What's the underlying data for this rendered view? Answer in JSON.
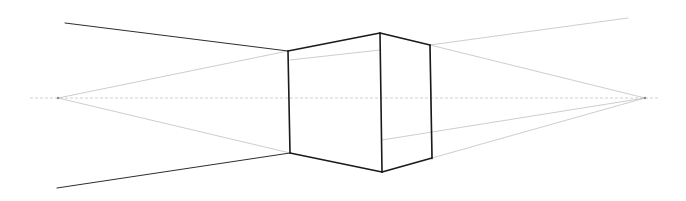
{
  "drawing": {
    "title": "Two-point perspective box sketch",
    "background": "#ffffff",
    "horizon_line": {
      "x1": 30,
      "y1": 98,
      "x2": 660,
      "y2": 98
    },
    "vanishing_points": {
      "left": {
        "x": 58,
        "y": 98
      },
      "right": {
        "x": 645,
        "y": 98
      }
    },
    "box": {
      "left_edge": {
        "x1": 288,
        "y1": 51,
        "x2": 290,
        "y2": 153
      },
      "front_edge": {
        "x1": 380,
        "y1": 33,
        "x2": 382,
        "y2": 172
      },
      "right_edge": {
        "x1": 430,
        "y1": 45,
        "x2": 432,
        "y2": 158
      },
      "top_left": {
        "x1": 288,
        "y1": 51,
        "x2": 380,
        "y2": 33
      },
      "top_right": {
        "x1": 380,
        "y1": 33,
        "x2": 430,
        "y2": 45
      },
      "bottom_left": {
        "x1": 290,
        "y1": 153,
        "x2": 382,
        "y2": 172
      },
      "bottom_right": {
        "x1": 382,
        "y1": 172,
        "x2": 432,
        "y2": 158
      }
    },
    "extension_lines": [
      {
        "name": "upper-left-ray",
        "x1": 65,
        "y1": 23,
        "x2": 288,
        "y2": 51,
        "style": "medium"
      },
      {
        "name": "lower-left-ray",
        "x1": 57,
        "y1": 188,
        "x2": 290,
        "y2": 153,
        "style": "medium"
      }
    ],
    "guide_lines": [
      {
        "name": "left-vp-to-left-top",
        "x1": 58,
        "y1": 98,
        "x2": 288,
        "y2": 51
      },
      {
        "name": "left-vp-to-left-bottom",
        "x1": 58,
        "y1": 98,
        "x2": 290,
        "y2": 153
      },
      {
        "name": "right-vp-to-right-top",
        "x1": 645,
        "y1": 98,
        "x2": 430,
        "y2": 45
      },
      {
        "name": "right-vp-to-right-bottom",
        "x1": 645,
        "y1": 98,
        "x2": 432,
        "y2": 158
      },
      {
        "name": "right-top-extension",
        "x1": 430,
        "y1": 45,
        "x2": 628,
        "y2": 18
      },
      {
        "name": "right-vp-to-front-inner",
        "x1": 645,
        "y1": 98,
        "x2": 382,
        "y2": 140
      },
      {
        "name": "left-front-guide",
        "x1": 290,
        "y1": 60,
        "x2": 380,
        "y2": 50
      }
    ],
    "hidden_edge": {
      "x1": 430,
      "y1": 45,
      "x2": 432,
      "y2": 160
    }
  }
}
